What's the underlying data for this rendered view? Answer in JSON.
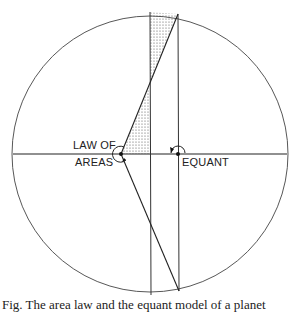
{
  "diagram": {
    "labels": {
      "law_of_areas_line1": "LAW OF",
      "law_of_areas_line2": "AREAS",
      "equant": "EQUANT"
    },
    "caption": "Fig.  The area law and the equant model of a planet"
  },
  "geometry": {
    "circle": {
      "cx": 150,
      "cy": 154,
      "r": 138
    },
    "horizontal_line_y": 154,
    "sun_point": [
      121,
      154
    ],
    "equant_point": [
      178,
      154
    ],
    "vertical_lines_x": [
      150,
      178
    ],
    "shading": "dotted"
  }
}
